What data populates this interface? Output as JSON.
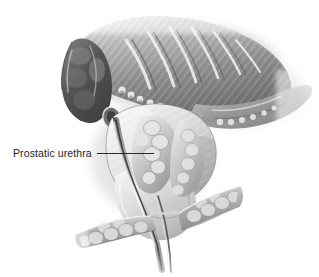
{
  "figure": {
    "type": "medical-illustration",
    "style": "grayscale airbrush / pencil rendering",
    "background_color": "#ffffff",
    "canvas": {
      "width": 319,
      "height": 277
    }
  },
  "labels": [
    {
      "id": "prostatic-urethra",
      "text": "Prostatic urethra",
      "text_color": "#1c1c1c",
      "font_size_px": 10.5,
      "x": 13,
      "y": 148,
      "leader": {
        "color": "#2a2a2a",
        "from_x": 97,
        "to_x": 154,
        "y": 153,
        "length": 57
      }
    }
  ],
  "structures": [
    {
      "name": "bladder-dome",
      "description": "Trabeculated bladder wall with diagonal muscular ridges",
      "tone": "#8d8d8d"
    },
    {
      "name": "bladder-lumen",
      "description": "Interior of bladder showing hypertrophied trabeculae",
      "tone": "#9b9b9b"
    },
    {
      "name": "left-lobular-mass",
      "description": "Dark rounded lobulated mass at upper left",
      "tone": "#5e5e5e"
    },
    {
      "name": "prostate-gland",
      "description": "Central prostate gland, pale with fine striations",
      "tone": "#cfcfcf"
    },
    {
      "name": "prostatic-urethra-channel",
      "description": "Urethral lumen running vertically through the prostate",
      "tone": "#3a3a3a"
    },
    {
      "name": "median-lobe",
      "description": "Nodular median lobe protruding into the urethra",
      "tone": "#b4b4b4"
    },
    {
      "name": "seminal-vesicle-left",
      "description": "Left diagonal lobulated seminal vesicle branch",
      "tone": "#a6a6a6"
    },
    {
      "name": "seminal-vesicle-right",
      "description": "Right diagonal lobulated seminal vesicle branch",
      "tone": "#a6a6a6"
    },
    {
      "name": "ejaculatory-duct",
      "description": "Dark duct continuing inferiorly from the prostate",
      "tone": "#4a4a4a"
    }
  ],
  "palette": {
    "white": "#ffffff",
    "lightest": "#ededed",
    "light": "#d4d4d4",
    "mid_light": "#bcbcbc",
    "mid": "#9e9e9e",
    "mid_dark": "#7c7c7c",
    "dark": "#5c5c5c",
    "darkest": "#343434",
    "outline": "#2a2a2a"
  }
}
